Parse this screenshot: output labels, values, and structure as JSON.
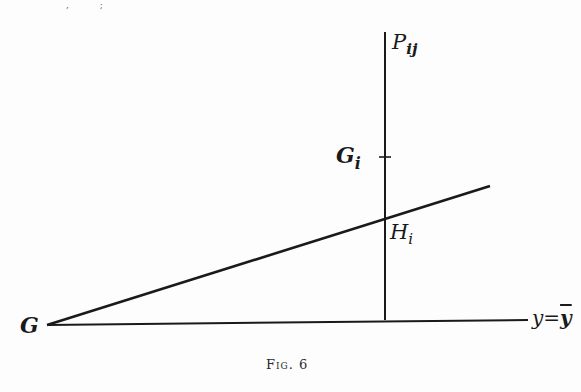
{
  "figure": {
    "caption": "Fig. 6",
    "labels": {
      "P": {
        "main": "P",
        "sub": "ij"
      },
      "Gi": {
        "main": "G",
        "sub": "i"
      },
      "Hi": {
        "main": "H",
        "sub": "i"
      },
      "G": {
        "main": "G"
      },
      "line_eq": {
        "lhs": "y",
        "eq": "=",
        "rhs": "y"
      }
    },
    "top_residue": ", ;",
    "geometry": {
      "vertical_line": {
        "x": 385,
        "y_top": 32,
        "y_bottom": 320
      },
      "base_line": {
        "x1": 47,
        "y1": 325,
        "x2": 528,
        "y2": 320
      },
      "slanted_line": {
        "x1": 47,
        "y1": 325,
        "x2": 490,
        "y2": 186
      },
      "tick_Gi": {
        "x": 385,
        "y": 157,
        "half_width": 6
      },
      "intersection_Hi": {
        "x": 385,
        "y": 218
      }
    },
    "colors": {
      "ink": "#1a1a1a",
      "paper": "#fdfdfd"
    }
  }
}
